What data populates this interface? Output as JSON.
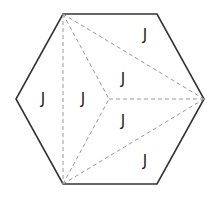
{
  "diagram": {
    "shape": "hexagon",
    "vertices": {
      "top_left": [
        63,
        14
      ],
      "top_right": [
        157,
        14
      ],
      "right": [
        204,
        99
      ],
      "bottom_right": [
        157,
        184
      ],
      "bottom_left": [
        63,
        184
      ],
      "left": [
        16,
        99
      ]
    },
    "inner_point": [
      109,
      99
    ],
    "outline_color": "#333333",
    "dashed_color": "#999999",
    "labels": [
      {
        "text": "J",
        "x": 43,
        "y": 99
      },
      {
        "text": "J",
        "x": 83,
        "y": 99
      },
      {
        "text": "J",
        "x": 123,
        "y": 79
      },
      {
        "text": "J",
        "x": 123,
        "y": 121
      },
      {
        "text": "J",
        "x": 145,
        "y": 35
      },
      {
        "text": "J",
        "x": 145,
        "y": 161
      }
    ]
  }
}
